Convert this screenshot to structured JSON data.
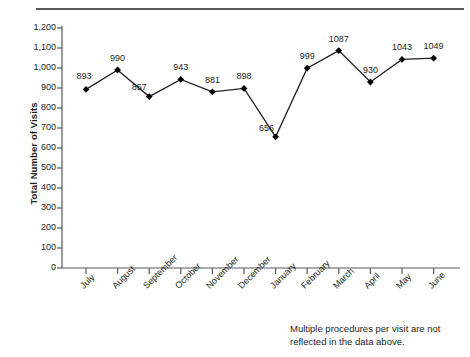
{
  "figure": {
    "top_rule_color": "#58595b",
    "footnote_line1": "Multiple procedures per visit are not",
    "footnote_line2": "reflected in the data above."
  },
  "chart_data": {
    "type": "line",
    "title": "",
    "xlabel": "",
    "ylabel": "Total Number of Visits",
    "categories": [
      "July",
      "August",
      "September",
      "October",
      "November",
      "December",
      "January",
      "February",
      "March",
      "April",
      "May",
      "June"
    ],
    "values": [
      893,
      990,
      857,
      943,
      881,
      898,
      656,
      999,
      1087,
      930,
      1043,
      1049
    ],
    "point_labels": [
      "893",
      "990",
      "857",
      "943",
      "881",
      "898",
      "656",
      "999",
      "1087",
      "930",
      "1043",
      "1049"
    ],
    "ylim": [
      0,
      1200
    ],
    "ytick_values": [
      0,
      100,
      200,
      300,
      400,
      500,
      600,
      700,
      800,
      900,
      1000,
      1100,
      1200
    ],
    "ytick_labels": [
      "0",
      "100",
      "200",
      "300",
      "400",
      "500",
      "600",
      "700",
      "800",
      "900",
      "1,000",
      "1,100",
      "1,200"
    ],
    "grid": false,
    "legend": false,
    "marker": "diamond",
    "marker_color": "#000000",
    "line_color": "#231f20"
  }
}
